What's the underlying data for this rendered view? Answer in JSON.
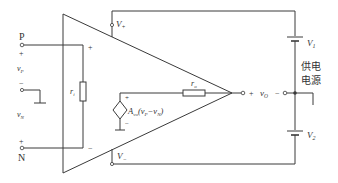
{
  "diagram": {
    "title": "",
    "type": "op-amp equivalent circuit",
    "colors": {
      "wire": "#3a3a3a",
      "text": "#333333",
      "background": "#ffffff"
    },
    "terminals": {
      "P": {
        "label": "P",
        "plus": "+",
        "voltage_main": "v",
        "voltage_sub": "P",
        "minus": "−"
      },
      "N": {
        "label": "N",
        "plus": "+",
        "voltage_main": "v",
        "voltage_sub": "N"
      }
    },
    "amplifier": {
      "input_plus": "+",
      "input_minus": "−",
      "supply_plus": {
        "main": "V",
        "sub": "+"
      },
      "supply_minus": {
        "main": "V",
        "sub": "−"
      }
    },
    "components": {
      "input_resistor": {
        "main": "r",
        "sub": "i"
      },
      "output_resistor": {
        "main": "r",
        "sub": "o"
      },
      "dependent_source": {
        "plus": "+",
        "minus": "−",
        "gain_main": "A",
        "gain_sub": "vo",
        "expr_open": "(v",
        "expr_p_sub": "P",
        "expr_mid": "−v",
        "expr_n_sub": "N",
        "expr_close": ")"
      }
    },
    "output": {
      "plus": "+",
      "main": "v",
      "sub": "O",
      "minus": "−"
    },
    "supply": {
      "V1": {
        "main": "V",
        "sub": "1"
      },
      "V2": {
        "main": "V",
        "sub": "2"
      },
      "label_line1": "供电",
      "label_line2": "电源"
    }
  }
}
